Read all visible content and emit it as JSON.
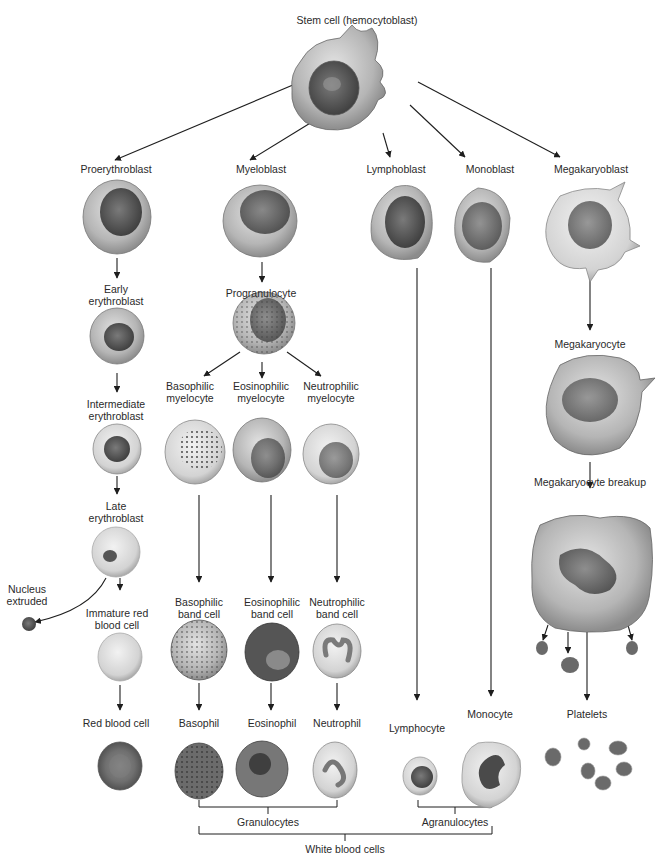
{
  "title": "Stem cell (hemocytoblast)",
  "lineages": {
    "erythroid": [
      "Proerythroblast",
      "Early erythroblast",
      "Intermediate erythroblast",
      "Late erythroblast",
      "Immature red blood cell",
      "Red blood cell"
    ],
    "myeloid": [
      "Myeloblast",
      "Progranulocyte"
    ],
    "basophil": [
      "Basophilic myelocyte",
      "Basophilic band cell",
      "Basophil"
    ],
    "eosinophil": [
      "Eosinophilic myelocyte",
      "Eosinophilic band cell",
      "Eosinophil"
    ],
    "neutrophil": [
      "Neutrophilic myelocyte",
      "Neutrophilic band cell",
      "Neutrophil"
    ],
    "lymphoid": [
      "Lymphoblast",
      "Lymphocyte"
    ],
    "monocytic": [
      "Monoblast",
      "Monocyte"
    ],
    "megakaryocytic": [
      "Megakaryoblast",
      "Megakaryocyte",
      "Megakaryocyte breakup",
      "Platelets"
    ]
  },
  "labels": {
    "stem": "Stem cell (hemocytoblast)",
    "proerythroblast": "Proerythroblast",
    "myeloblast": "Myeloblast",
    "lymphoblast": "Lymphoblast",
    "monoblast": "Monoblast",
    "megakaryoblast": "Megakaryoblast",
    "early_erythroblast_1": "Early",
    "early_erythroblast_2": "erythroblast",
    "progranulocyte": "Progranulocyte",
    "megakaryocyte": "Megakaryocyte",
    "intermediate_1": "Intermediate",
    "intermediate_2": "erythroblast",
    "baso_myelo_1": "Basophilic",
    "baso_myelo_2": "myelocyte",
    "eos_myelo_1": "Eosinophilic",
    "eos_myelo_2": "myelocyte",
    "neut_myelo_1": "Neutrophilic",
    "neut_myelo_2": "myelocyte",
    "late_1": "Late",
    "late_2": "erythroblast",
    "breakup": "Megakaryocyte breakup",
    "nucleus_1": "Nucleus",
    "nucleus_2": "extruded",
    "immature_1": "Immature red",
    "immature_2": "blood cell",
    "baso_band_1": "Basophilic",
    "baso_band_2": "band cell",
    "eos_band_1": "Eosinophilic",
    "eos_band_2": "band cell",
    "neut_band_1": "Neutrophilic",
    "neut_band_2": "band cell",
    "rbc": "Red blood cell",
    "basophil": "Basophil",
    "eosinophil": "Eosinophil",
    "neutrophil": "Neutrophil",
    "lymphocyte": "Lymphocyte",
    "monocyte": "Monocyte",
    "platelets": "Platelets",
    "granulocytes": "Granulocytes",
    "agranulocytes": "Agranulocytes",
    "white_blood_cells": "White blood cells"
  },
  "colors": {
    "cytoplasm": "#b9b9b9",
    "cytoplasm_light": "#dcdcdc",
    "nucleus": "#5a5a5a",
    "nucleus_dark": "#3a3a3a",
    "line": "#1e1e1e"
  }
}
